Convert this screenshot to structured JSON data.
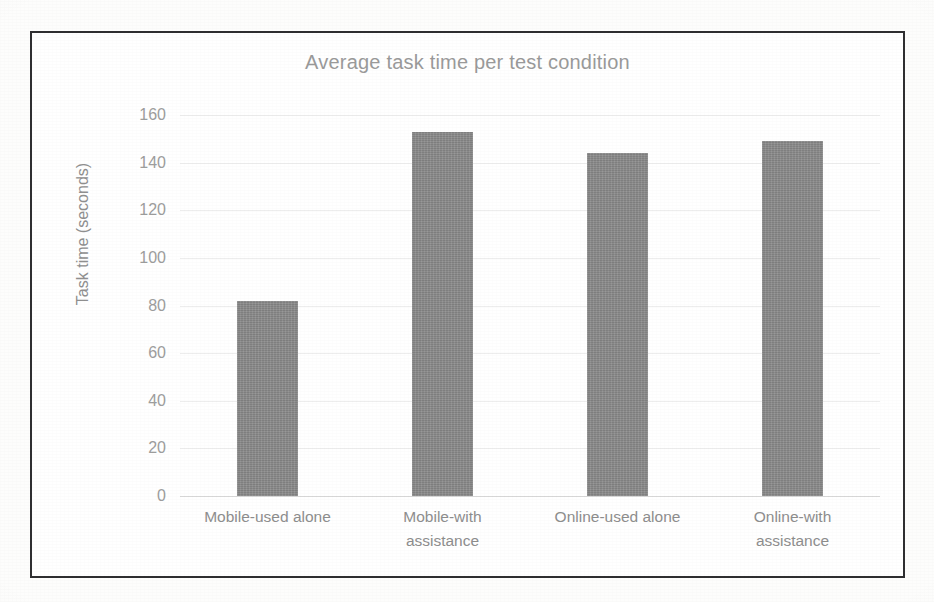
{
  "figure": {
    "title": "Average task time per test condition",
    "frame_color": "#2f2f31",
    "bar_color": "#8c8c8c",
    "text_color": "#9a9a9a",
    "gridline_color": "#ededed"
  },
  "chart_data": {
    "type": "bar",
    "title": "Average task time per test condition",
    "xlabel": "",
    "ylabel": "Task time (seconds)",
    "categories": [
      "Mobile-used alone",
      "Mobile-with assistance",
      "Online-used alone",
      "Online-with assistance"
    ],
    "category_lines": [
      [
        "Mobile-used alone"
      ],
      [
        "Mobile-with",
        "assistance"
      ],
      [
        "Online-used alone"
      ],
      [
        "Online-with",
        "assistance"
      ]
    ],
    "values": [
      82,
      153,
      144,
      149
    ],
    "ylim": [
      0,
      160
    ],
    "ytick_labels": [
      "0",
      "20",
      "40",
      "60",
      "80",
      "100",
      "120",
      "140",
      "160"
    ],
    "ytick_values": [
      0,
      20,
      40,
      60,
      80,
      100,
      120,
      140,
      160
    ],
    "grid": true,
    "legend": "none",
    "series": [
      {
        "name": "Average task time",
        "values": [
          82,
          153,
          144,
          149
        ]
      }
    ]
  }
}
